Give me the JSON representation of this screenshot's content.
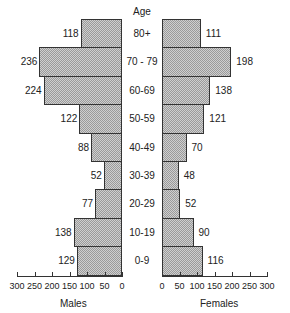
{
  "chart_data": {
    "type": "bar",
    "subtype": "population-pyramid",
    "title": "",
    "center_label": "Age",
    "categories": [
      "80+",
      "70 - 79",
      "60-69",
      "50-59",
      "40-49",
      "30-39",
      "20-29",
      "10-19",
      "0-9"
    ],
    "series": [
      {
        "name": "Males",
        "values": [
          118,
          236,
          224,
          122,
          88,
          52,
          77,
          138,
          129
        ]
      },
      {
        "name": "Females",
        "values": [
          111,
          198,
          138,
          121,
          70,
          48,
          52,
          90,
          116
        ]
      }
    ],
    "xlabel_left": "Males",
    "xlabel_right": "Females",
    "left_ticks": [
      "300",
      "250",
      "200",
      "150",
      "100",
      "50",
      "0"
    ],
    "right_ticks": [
      "0",
      "50",
      "100",
      "150",
      "200",
      "250",
      "300"
    ],
    "xlim": [
      0,
      300
    ],
    "grid": false,
    "legend": "none"
  }
}
